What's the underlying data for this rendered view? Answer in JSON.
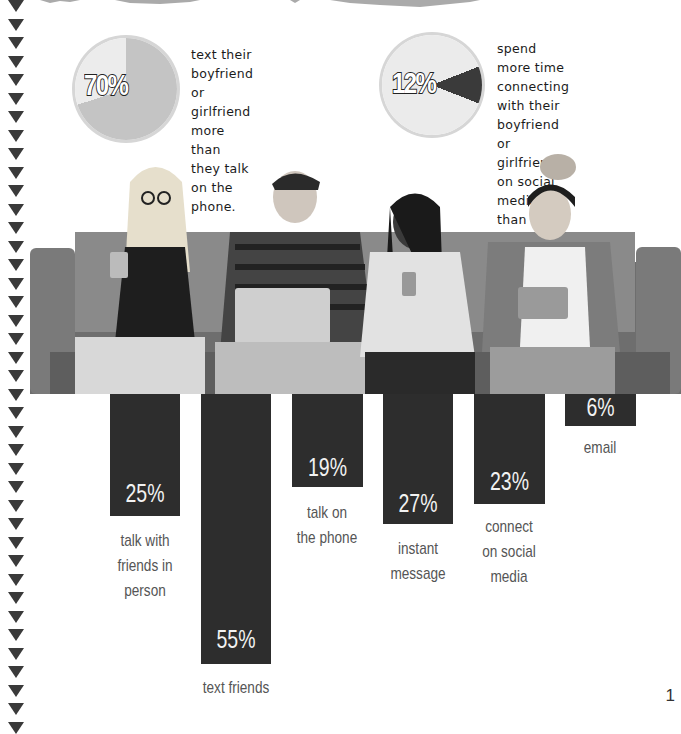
{
  "pies": [
    {
      "value": "70%",
      "text_lines": [
        "text their",
        "boyfriend or",
        "girlfriend more",
        "than they talk",
        "on the phone."
      ],
      "highlight_pct": 70,
      "colors": {
        "base": "#ececec",
        "slice": "#c4c4c4"
      }
    },
    {
      "value": "12%",
      "text_lines": [
        "spend more time",
        "connecting with their",
        "boyfriend or girlfriend",
        "on social media than",
        "in person."
      ],
      "highlight_pct": 12,
      "colors": {
        "base": "#ebebeb",
        "slice": "#3a3a3a"
      }
    }
  ],
  "bars": [
    {
      "value": "25%",
      "label_lines": [
        "talk with",
        "friends in",
        "person"
      ]
    },
    {
      "value": "55%",
      "label_lines": [
        "text friends"
      ]
    },
    {
      "value": "19%",
      "label_lines": [
        "talk on",
        "the phone"
      ]
    },
    {
      "value": "27%",
      "label_lines": [
        "instant",
        "message"
      ]
    },
    {
      "value": "23%",
      "label_lines": [
        "connect",
        "on social",
        "media"
      ]
    },
    {
      "value": "6%",
      "label_lines": [
        "email"
      ]
    }
  ],
  "photo": {
    "description": "four teens sitting on a couch using phones, laptop and tablet"
  },
  "page_number": "1",
  "colors": {
    "bar": "#2d2d2d",
    "triangle": "#3a3a3a",
    "label": "#555555"
  },
  "chart_data": [
    {
      "type": "bar",
      "title": "",
      "categories": [
        "talk with friends in person",
        "text friends",
        "talk on the phone",
        "instant message",
        "connect on social media",
        "email"
      ],
      "values": [
        25,
        55,
        19,
        27,
        23,
        6
      ],
      "xlabel": "",
      "ylabel": "",
      "ylim": [
        0,
        60
      ],
      "orientation": "downward",
      "grid": false
    },
    {
      "type": "pie",
      "categories": [
        "text boyfriend or girlfriend more than they talk on the phone",
        "other"
      ],
      "values": [
        70,
        30
      ],
      "title": "70%"
    },
    {
      "type": "pie",
      "categories": [
        "spend more time connecting with boyfriend or girlfriend on social media than in person",
        "other"
      ],
      "values": [
        12,
        88
      ],
      "title": "12%"
    }
  ]
}
